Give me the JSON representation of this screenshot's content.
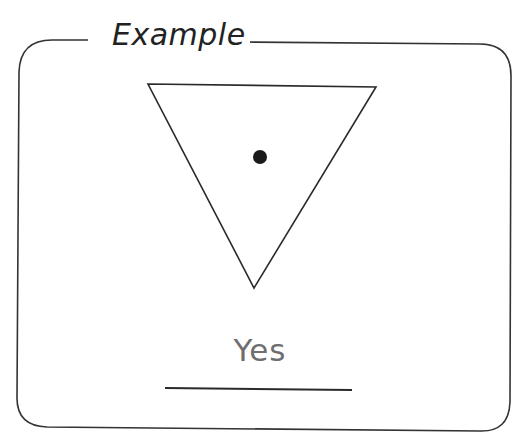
{
  "card": {
    "title": "Example",
    "answer": "Yes",
    "border_color": "#333333",
    "answer_color": "#6e6e6e"
  },
  "figure": {
    "shape": "inverted-triangle",
    "triangle_points": [
      [
        148,
        84
      ],
      [
        376,
        87
      ],
      [
        254,
        288
      ]
    ],
    "dot": {
      "cx": 260,
      "cy": 157,
      "r": 7,
      "position": "inside"
    }
  },
  "answer_line": {
    "x1": 165,
    "x2": 352,
    "y": 389
  }
}
